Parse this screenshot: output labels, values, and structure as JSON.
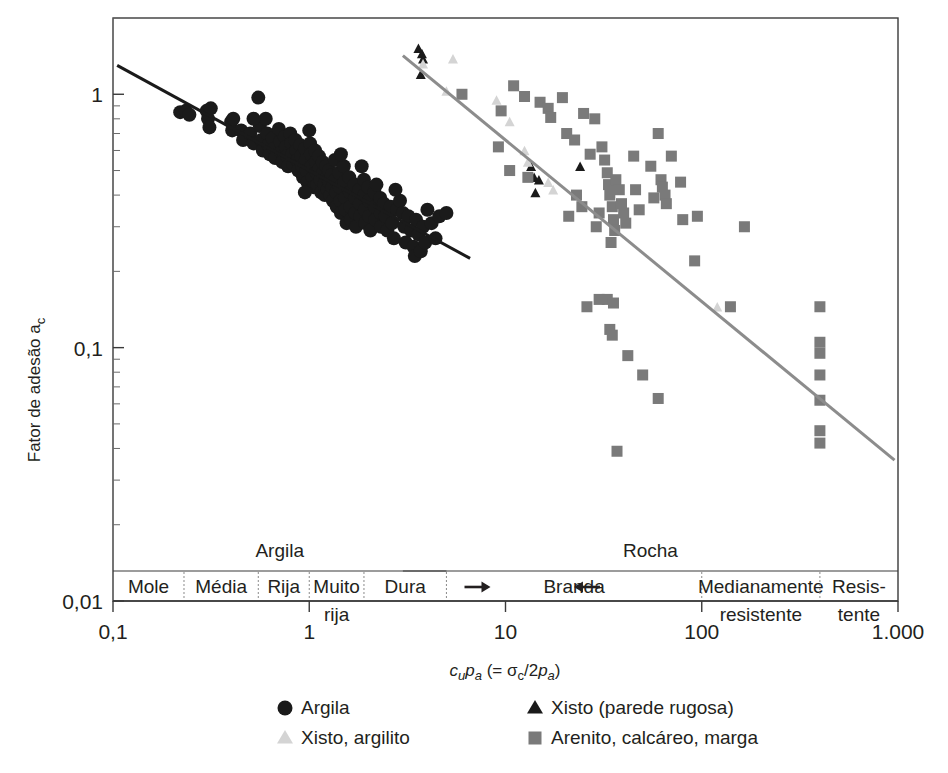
{
  "figure": {
    "kind": "scatter-plot",
    "background": "#ffffff"
  },
  "axes": {
    "x": {
      "label_parts": {
        "c": "c",
        "u": "u",
        "p": "p",
        "a1": "a",
        "paren_open": " (= ",
        "sigma": "σ",
        "c2": "c",
        "slash2": "/2",
        "p2": "p",
        "a2": "a",
        "paren_close": ")"
      },
      "label_plain": "cupa (= σc/2pa)",
      "scale": "log",
      "min": 0.1,
      "max": 1000,
      "ticks": [
        "0,1",
        "1",
        "10",
        "100",
        "1.000"
      ],
      "tick_values": [
        0.1,
        1,
        10,
        100,
        1000
      ]
    },
    "y": {
      "label_plain": "Fator de adesão a",
      "label_sub": "c",
      "scale": "log",
      "min": 0.01,
      "max": 2.0,
      "ticks": [
        "1",
        "0,1",
        "0,01"
      ],
      "tick_values": [
        1,
        0.1,
        0.01
      ]
    }
  },
  "bands": {
    "groups": [
      {
        "name": "Argila",
        "label": "Argila",
        "from": 0.1,
        "to": 5.0
      },
      {
        "name": "Rocha",
        "label": "Rocha",
        "from": 3.0,
        "to": 1000
      }
    ],
    "cells": [
      {
        "label": "Mole",
        "from": 0.1,
        "to": 0.23,
        "multiline": false
      },
      {
        "label": "Média",
        "from": 0.23,
        "to": 0.55,
        "multiline": false
      },
      {
        "label": "Rija",
        "from": 0.55,
        "to": 1.0,
        "multiline": false
      },
      {
        "label": "Muito",
        "label2": "rija",
        "from": 1.0,
        "to": 1.9,
        "multiline": true
      },
      {
        "label": "Dura",
        "from": 1.9,
        "to": 5.0,
        "multiline": false
      },
      {
        "label": "Branda",
        "from": 5.0,
        "to": 100,
        "multiline": false
      },
      {
        "label": "Medianamente",
        "label2": "resistente",
        "from": 100,
        "to": 400,
        "multiline": true
      },
      {
        "label": "Resis-",
        "label2": "tente",
        "from": 400,
        "to": 1000,
        "multiline": true
      }
    ],
    "arrows": [
      {
        "name": "argila-arrow-right",
        "direction": "right",
        "at_x": 7.2
      },
      {
        "name": "rocha-arrow-left",
        "direction": "left",
        "at_x": 26
      }
    ]
  },
  "legend": {
    "entries": [
      {
        "key": "clay",
        "marker": "circle",
        "color": "#1a1a1a",
        "label": "Argila"
      },
      {
        "key": "shale_r",
        "marker": "triangle",
        "color": "#1a1a1a",
        "label": "Xisto (parede rugosa)"
      },
      {
        "key": "shale_ms",
        "marker": "triangle-light",
        "color": "#d4d4d4",
        "label": "Xisto, argilito"
      },
      {
        "key": "sandstone",
        "marker": "square",
        "color": "#7a7a7a",
        "label": "Arenito, calcáreo, marga"
      }
    ]
  },
  "chart_data": {
    "type": "scatter",
    "title": "",
    "xlabel": "cupa (= σc/2pa)",
    "ylabel": "Fator de adesão ac",
    "xscale": "log",
    "yscale": "log",
    "xlim": [
      0.1,
      1000
    ],
    "ylim": [
      0.01,
      2.0
    ],
    "grid": false,
    "legend_position": "below-axes",
    "series": [
      {
        "name": "Argila",
        "marker": "circle",
        "color": "#1a1a1a",
        "size": 11,
        "points": [
          [
            0.22,
            0.85
          ],
          [
            0.235,
            0.86
          ],
          [
            0.245,
            0.83
          ],
          [
            0.3,
            0.86
          ],
          [
            0.305,
            0.8
          ],
          [
            0.31,
            0.74
          ],
          [
            0.315,
            0.88
          ],
          [
            0.4,
            0.78
          ],
          [
            0.405,
            0.72
          ],
          [
            0.41,
            0.8
          ],
          [
            0.45,
            0.72
          ],
          [
            0.46,
            0.66
          ],
          [
            0.5,
            0.7
          ],
          [
            0.52,
            0.64
          ],
          [
            0.55,
            0.97
          ],
          [
            0.56,
            0.75
          ],
          [
            0.57,
            0.66
          ],
          [
            0.58,
            0.6
          ],
          [
            0.6,
            0.8
          ],
          [
            0.61,
            0.7
          ],
          [
            0.62,
            0.63
          ],
          [
            0.63,
            0.58
          ],
          [
            0.65,
            0.67
          ],
          [
            0.66,
            0.61
          ],
          [
            0.67,
            0.56
          ],
          [
            0.7,
            0.73
          ],
          [
            0.71,
            0.65
          ],
          [
            0.72,
            0.59
          ],
          [
            0.73,
            0.54
          ],
          [
            0.75,
            0.68
          ],
          [
            0.76,
            0.62
          ],
          [
            0.77,
            0.57
          ],
          [
            0.78,
            0.52
          ],
          [
            0.8,
            0.7
          ],
          [
            0.81,
            0.64
          ],
          [
            0.82,
            0.58
          ],
          [
            0.83,
            0.53
          ],
          [
            0.85,
            0.66
          ],
          [
            0.86,
            0.6
          ],
          [
            0.87,
            0.55
          ],
          [
            0.88,
            0.5
          ],
          [
            0.9,
            0.63
          ],
          [
            0.91,
            0.57
          ],
          [
            0.92,
            0.52
          ],
          [
            0.93,
            0.47
          ],
          [
            0.95,
            0.61
          ],
          [
            0.96,
            0.55
          ],
          [
            0.97,
            0.5
          ],
          [
            0.98,
            0.45
          ],
          [
            1.0,
            0.72
          ],
          [
            1.01,
            0.64
          ],
          [
            1.02,
            0.58
          ],
          [
            1.03,
            0.52
          ],
          [
            1.04,
            0.47
          ],
          [
            1.05,
            0.43
          ],
          [
            1.07,
            0.6
          ],
          [
            1.08,
            0.54
          ],
          [
            1.09,
            0.49
          ],
          [
            1.1,
            0.44
          ],
          [
            1.12,
            0.57
          ],
          [
            1.13,
            0.51
          ],
          [
            1.14,
            0.46
          ],
          [
            1.15,
            0.41
          ],
          [
            1.17,
            0.54
          ],
          [
            1.18,
            0.49
          ],
          [
            1.19,
            0.44
          ],
          [
            1.2,
            0.4
          ],
          [
            1.22,
            0.52
          ],
          [
            1.23,
            0.47
          ],
          [
            1.24,
            0.42
          ],
          [
            1.26,
            0.5
          ],
          [
            1.27,
            0.45
          ],
          [
            1.28,
            0.4
          ],
          [
            1.3,
            0.48
          ],
          [
            1.31,
            0.43
          ],
          [
            1.32,
            0.38
          ],
          [
            1.35,
            0.55
          ],
          [
            1.36,
            0.46
          ],
          [
            1.37,
            0.41
          ],
          [
            1.38,
            0.36
          ],
          [
            1.42,
            0.49
          ],
          [
            1.43,
            0.43
          ],
          [
            1.44,
            0.38
          ],
          [
            1.45,
            0.34
          ],
          [
            1.5,
            0.52
          ],
          [
            1.51,
            0.45
          ],
          [
            1.52,
            0.39
          ],
          [
            1.53,
            0.35
          ],
          [
            1.55,
            0.31
          ],
          [
            1.6,
            0.47
          ],
          [
            1.61,
            0.41
          ],
          [
            1.62,
            0.36
          ],
          [
            1.63,
            0.32
          ],
          [
            1.7,
            0.44
          ],
          [
            1.71,
            0.39
          ],
          [
            1.72,
            0.34
          ],
          [
            1.73,
            0.3
          ],
          [
            1.8,
            0.42
          ],
          [
            1.81,
            0.37
          ],
          [
            1.82,
            0.33
          ],
          [
            1.9,
            0.46
          ],
          [
            1.91,
            0.4
          ],
          [
            1.92,
            0.35
          ],
          [
            1.93,
            0.31
          ],
          [
            2.0,
            0.43
          ],
          [
            2.01,
            0.38
          ],
          [
            2.02,
            0.33
          ],
          [
            2.05,
            0.29
          ],
          [
            2.15,
            0.41
          ],
          [
            2.16,
            0.36
          ],
          [
            2.17,
            0.32
          ],
          [
            2.3,
            0.39
          ],
          [
            2.31,
            0.34
          ],
          [
            2.32,
            0.3
          ],
          [
            2.4,
            0.37
          ],
          [
            2.45,
            0.33
          ],
          [
            2.5,
            0.29
          ],
          [
            2.6,
            0.36
          ],
          [
            2.65,
            0.31
          ],
          [
            2.7,
            0.27
          ],
          [
            2.8,
            0.35
          ],
          [
            2.9,
            0.38
          ],
          [
            3.0,
            0.34
          ],
          [
            3.05,
            0.3
          ],
          [
            3.1,
            0.26
          ],
          [
            3.2,
            0.33
          ],
          [
            3.3,
            0.29
          ],
          [
            3.4,
            0.25
          ],
          [
            3.45,
            0.23
          ],
          [
            3.5,
            0.32
          ],
          [
            3.6,
            0.28
          ],
          [
            3.7,
            0.24
          ],
          [
            3.8,
            0.3
          ],
          [
            3.9,
            0.26
          ],
          [
            4.0,
            0.35
          ],
          [
            4.2,
            0.31
          ],
          [
            4.4,
            0.27
          ],
          [
            4.6,
            0.33
          ],
          [
            5.0,
            0.34
          ],
          [
            0.52,
            0.8
          ],
          [
            0.95,
            0.41
          ],
          [
            1.45,
            0.58
          ],
          [
            1.85,
            0.52
          ],
          [
            2.2,
            0.44
          ],
          [
            2.75,
            0.42
          ]
        ]
      },
      {
        "name": "Xisto (parede rugosa)",
        "marker": "triangle",
        "color": "#1a1a1a",
        "size": 10,
        "points": [
          [
            3.6,
            1.52
          ],
          [
            3.75,
            1.45
          ],
          [
            3.8,
            1.38
          ],
          [
            3.7,
            1.2
          ],
          [
            13.5,
            0.52
          ],
          [
            14.0,
            0.47
          ],
          [
            14.8,
            0.46
          ],
          [
            14.2,
            0.41
          ],
          [
            24.0,
            0.52
          ]
        ]
      },
      {
        "name": "Xisto, argilito",
        "marker": "triangle-light",
        "color": "#d4d4d4",
        "size": 10,
        "points": [
          [
            3.8,
            1.32
          ],
          [
            5.4,
            1.38
          ],
          [
            5.0,
            1.03
          ],
          [
            9.0,
            0.95
          ],
          [
            10.5,
            0.78
          ],
          [
            12.5,
            0.6
          ],
          [
            13.0,
            0.54
          ],
          [
            16.5,
            0.45
          ],
          [
            17.5,
            0.42
          ],
          [
            120,
            0.145
          ]
        ]
      },
      {
        "name": "Arenito, calcáreo, marga",
        "marker": "square",
        "color": "#7a7a7a",
        "size": 11,
        "points": [
          [
            6.0,
            1.0
          ],
          [
            9.5,
            0.86
          ],
          [
            11.0,
            1.08
          ],
          [
            12.5,
            0.98
          ],
          [
            10.5,
            0.5
          ],
          [
            13.0,
            0.47
          ],
          [
            9.2,
            0.62
          ],
          [
            15.0,
            0.93
          ],
          [
            16.5,
            0.88
          ],
          [
            17.0,
            0.81
          ],
          [
            19.5,
            0.97
          ],
          [
            20.5,
            0.7
          ],
          [
            22.5,
            0.66
          ],
          [
            25.0,
            0.84
          ],
          [
            27.0,
            0.58
          ],
          [
            28.5,
            0.8
          ],
          [
            31.0,
            0.62
          ],
          [
            32.0,
            0.55
          ],
          [
            33.0,
            0.49
          ],
          [
            33.5,
            0.44
          ],
          [
            34.0,
            0.4
          ],
          [
            35.0,
            0.36
          ],
          [
            35.5,
            0.32
          ],
          [
            36.0,
            0.29
          ],
          [
            34.5,
            0.26
          ],
          [
            36.5,
            0.46
          ],
          [
            38.0,
            0.42
          ],
          [
            39.0,
            0.37
          ],
          [
            40.0,
            0.34
          ],
          [
            41.0,
            0.31
          ],
          [
            30.0,
            0.34
          ],
          [
            29.0,
            0.3
          ],
          [
            23.0,
            0.4
          ],
          [
            24.5,
            0.36
          ],
          [
            21.0,
            0.33
          ],
          [
            45.0,
            0.57
          ],
          [
            46.0,
            0.42
          ],
          [
            48.0,
            0.35
          ],
          [
            55.0,
            0.52
          ],
          [
            57.0,
            0.39
          ],
          [
            60.0,
            0.7
          ],
          [
            62.0,
            0.46
          ],
          [
            63.0,
            0.43
          ],
          [
            65.0,
            0.4
          ],
          [
            66.0,
            0.37
          ],
          [
            70.0,
            0.57
          ],
          [
            78.0,
            0.45
          ],
          [
            80.0,
            0.32
          ],
          [
            95.0,
            0.33
          ],
          [
            30.0,
            0.155
          ],
          [
            33.0,
            0.155
          ],
          [
            35.5,
            0.15
          ],
          [
            26.0,
            0.145
          ],
          [
            34.0,
            0.118
          ],
          [
            35.0,
            0.112
          ],
          [
            42.0,
            0.093
          ],
          [
            50.0,
            0.078
          ],
          [
            60.0,
            0.063
          ],
          [
            37.0,
            0.039
          ],
          [
            140,
            0.145
          ],
          [
            165,
            0.3
          ],
          [
            400,
            0.105
          ],
          [
            400,
            0.095
          ],
          [
            400,
            0.078
          ],
          [
            400,
            0.062
          ],
          [
            400,
            0.047
          ],
          [
            400,
            0.042
          ],
          [
            400,
            0.145
          ],
          [
            92.0,
            0.22
          ]
        ]
      }
    ],
    "trendlines": [
      {
        "name": "linha-argila",
        "color": "#1a1a1a",
        "width": 3,
        "x_from": 0.105,
        "y_from": 1.3,
        "x_to": 6.6,
        "y_to": 0.225
      },
      {
        "name": "linha-rocha",
        "color": "#8c8c8c",
        "width": 3,
        "x_from": 3.0,
        "y_from": 1.42,
        "x_to": 960,
        "y_to": 0.036
      }
    ]
  }
}
